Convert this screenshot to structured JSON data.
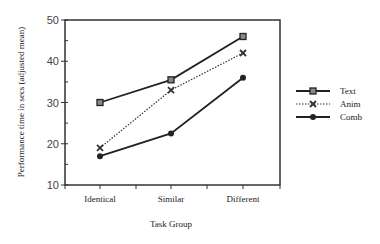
{
  "chart_data": {
    "type": "line",
    "title": "",
    "xlabel": "Task Group",
    "ylabel": "Performance time in secs (adjusted mean)",
    "categories": [
      "Identical",
      "Similar",
      "Different"
    ],
    "ylim": [
      10,
      50
    ],
    "yticks": [
      10,
      20,
      30,
      40,
      50
    ],
    "grid": false,
    "legend_position": "right",
    "series": [
      {
        "name": "Text",
        "values": [
          30,
          35.5,
          46
        ],
        "marker": "square",
        "line": "solid",
        "color": "#222222"
      },
      {
        "name": "Anim",
        "values": [
          19,
          33,
          42
        ],
        "marker": "x",
        "line": "dotted",
        "color": "#333333"
      },
      {
        "name": "Comb",
        "values": [
          17,
          22.5,
          36
        ],
        "marker": "circle",
        "line": "solid",
        "color": "#222222"
      }
    ]
  }
}
